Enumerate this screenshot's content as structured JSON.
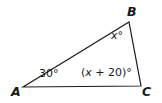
{
  "figure": {
    "type": "geometry-diagram",
    "shape": "triangle",
    "background_color": "#ffffff",
    "stroke_color": "#1a1a1a",
    "stroke_width": 1.2,
    "vertices": [
      {
        "name": "A",
        "label": "A",
        "x": 23,
        "y": 87
      },
      {
        "name": "B",
        "label": "B",
        "x": 129,
        "y": 22
      },
      {
        "name": "C",
        "label": "C",
        "x": 141,
        "y": 86
      }
    ],
    "edges": [
      {
        "name": "side-AB",
        "from": "A",
        "to": "B"
      },
      {
        "name": "side-BC",
        "from": "B",
        "to": "C"
      },
      {
        "name": "side-CA",
        "from": "C",
        "to": "A"
      }
    ],
    "angles": [
      {
        "at": "A",
        "label": "30°",
        "value": "30",
        "unit": "°"
      },
      {
        "at": "B",
        "label": "x°",
        "expression": "x",
        "unit": "°"
      },
      {
        "at": "C",
        "label": "(x + 20)°",
        "expression": "(x + 20)",
        "unit": "°"
      }
    ],
    "angle_text": {
      "a": "30°",
      "b_var": "x",
      "b_deg": "°",
      "c_open": "(",
      "c_var": "x",
      "c_rest": " + 20)",
      "c_deg": "°"
    }
  }
}
